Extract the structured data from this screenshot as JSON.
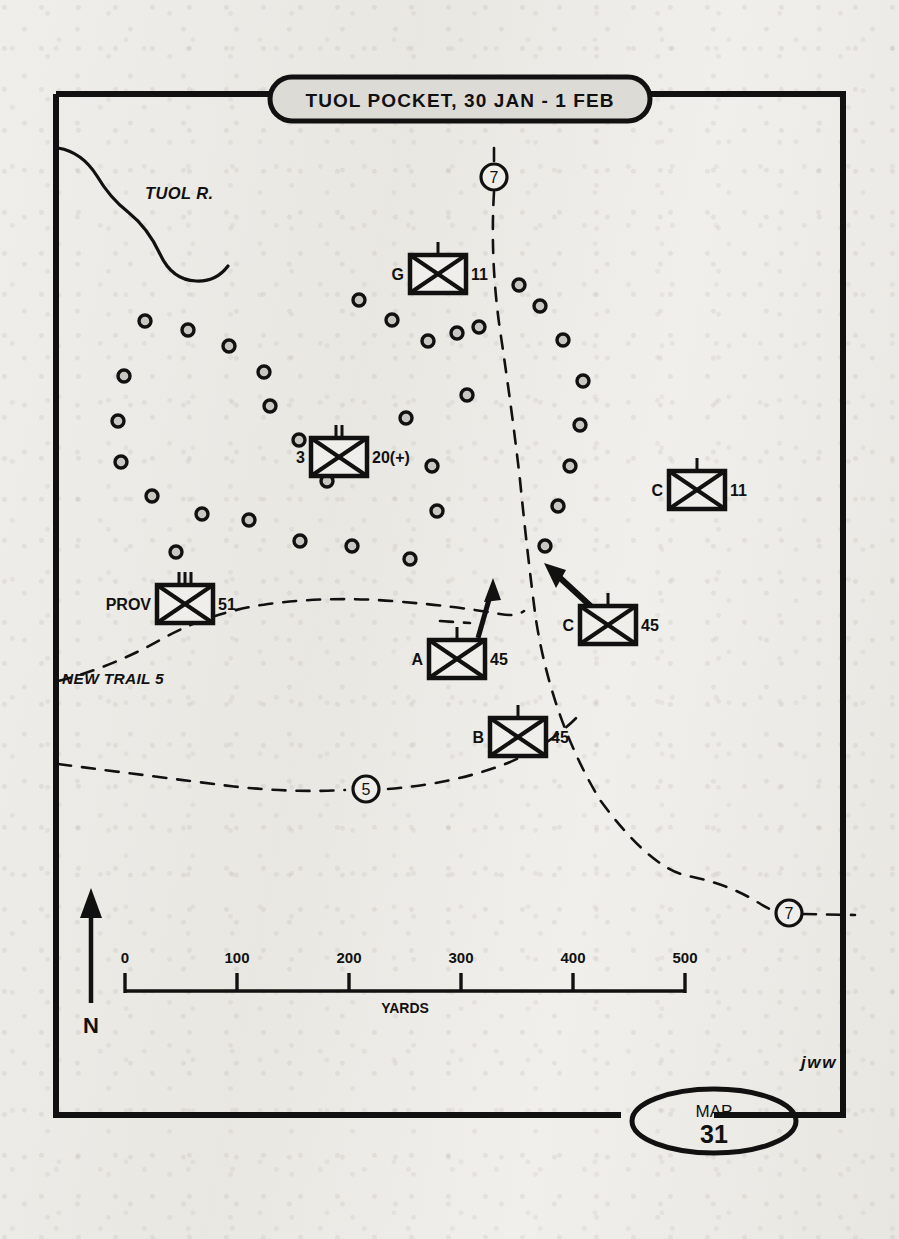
{
  "map": {
    "title": "TUOL POCKET, 30 JAN - 1 FEB",
    "map_label": "MAP",
    "map_number": "31",
    "signature": "jww",
    "north_label": "N",
    "river_label": "TUOL R.",
    "trail_label": "NEW TRAIL 5"
  },
  "scale": {
    "unit_label": "YARDS",
    "ticks": [
      "0",
      "100",
      "200",
      "300",
      "400",
      "500"
    ]
  },
  "route_markers": [
    {
      "id": "route-7-top",
      "label": "7",
      "x": 494,
      "y": 177
    },
    {
      "id": "route-5-bottom",
      "label": "5",
      "x": 366,
      "y": 789
    },
    {
      "id": "route-7-right",
      "label": "7",
      "x": 789,
      "y": 913
    }
  ],
  "units": [
    {
      "id": "unit-g-11",
      "designation": "G",
      "parent": "11",
      "echelon": "company",
      "x": 438,
      "y": 274
    },
    {
      "id": "unit-3-20",
      "designation": "3",
      "parent": "20(+)",
      "echelon": "battalion",
      "x": 339,
      "y": 457
    },
    {
      "id": "unit-c-11",
      "designation": "C",
      "parent": "11",
      "echelon": "company",
      "x": 697,
      "y": 490
    },
    {
      "id": "unit-prov-51",
      "designation": "PROV",
      "parent": "51",
      "echelon": "regiment",
      "x": 185,
      "y": 604
    },
    {
      "id": "unit-c-45",
      "designation": "C",
      "parent": "45",
      "echelon": "company",
      "x": 608,
      "y": 625
    },
    {
      "id": "unit-a-45",
      "designation": "A",
      "parent": "45",
      "echelon": "company",
      "x": 457,
      "y": 659
    },
    {
      "id": "unit-b-45",
      "designation": "B",
      "parent": "45",
      "echelon": "company",
      "x": 518,
      "y": 737
    }
  ],
  "enemy_positions": [
    [
      145,
      321
    ],
    [
      188,
      330
    ],
    [
      229,
      346
    ],
    [
      264,
      372
    ],
    [
      270,
      406
    ],
    [
      299,
      440
    ],
    [
      327,
      481
    ],
    [
      352,
      546
    ],
    [
      300,
      541
    ],
    [
      249,
      520
    ],
    [
      202,
      514
    ],
    [
      152,
      496
    ],
    [
      121,
      462
    ],
    [
      118,
      421
    ],
    [
      124,
      376
    ],
    [
      359,
      300
    ],
    [
      392,
      320
    ],
    [
      428,
      341
    ],
    [
      457,
      333
    ],
    [
      479,
      327
    ],
    [
      406,
      418
    ],
    [
      432,
      466
    ],
    [
      437,
      511
    ],
    [
      467,
      395
    ],
    [
      519,
      285
    ],
    [
      540,
      306
    ],
    [
      563,
      340
    ],
    [
      583,
      381
    ],
    [
      580,
      425
    ],
    [
      570,
      466
    ],
    [
      558,
      506
    ],
    [
      545,
      546
    ],
    [
      176,
      552
    ],
    [
      410,
      559
    ]
  ],
  "attack_arrows": [
    {
      "id": "arrow-left",
      "from": [
        478,
        638
      ],
      "to": [
        493,
        583
      ]
    },
    {
      "id": "arrow-right",
      "from": [
        594,
        609
      ],
      "to": [
        548,
        566
      ]
    }
  ]
}
